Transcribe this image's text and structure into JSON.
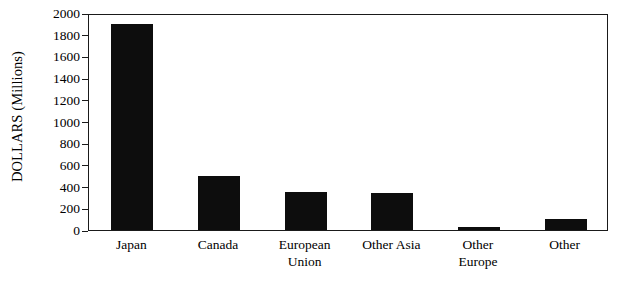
{
  "chart_data": {
    "type": "bar",
    "title": "",
    "subtitle": "",
    "xlabel": "",
    "ylabel": "DOLLARS (Millions)",
    "ylabel_parts": [
      "DOLLARS",
      "(Millions)"
    ],
    "categories": [
      "Japan",
      "Canada",
      "European Union",
      "Other Asia",
      "Other Europe",
      "Other"
    ],
    "category_lines": [
      [
        "Japan"
      ],
      [
        "Canada"
      ],
      [
        "European",
        "Union"
      ],
      [
        "Other Asia"
      ],
      [
        "Other",
        "Europe"
      ],
      [
        "Other"
      ]
    ],
    "values": [
      1900,
      500,
      350,
      340,
      25,
      100
    ],
    "ylim": [
      0,
      2000
    ],
    "yticks": [
      0,
      200,
      400,
      600,
      800,
      1000,
      1200,
      1400,
      1600,
      1800,
      2000
    ],
    "ytick_labels": [
      "0",
      "200",
      "400",
      "600",
      "800",
      "1000",
      "1200",
      "1400",
      "1600",
      "1800",
      "2000"
    ],
    "grid": false,
    "legend": false,
    "legend_position": "none",
    "bar_color": "#0d0d0d",
    "background_color": "#ffffff",
    "axis_color": "#1a1a1a",
    "orientation": "vertical"
  }
}
